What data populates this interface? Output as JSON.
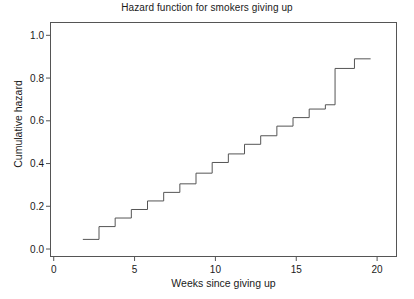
{
  "chart_data": {
    "type": "line",
    "subtype": "step",
    "title": "Hazard function for smokers giving up",
    "xlabel": "Weeks since giving up",
    "ylabel": "Cumulative hazard",
    "xlim": [
      -0.2,
      21.2
    ],
    "ylim": [
      -0.035,
      1.06
    ],
    "xticks": [
      0,
      5,
      10,
      15,
      20
    ],
    "xticklabels": [
      "0",
      "5",
      "10",
      "15",
      "20"
    ],
    "yticks": [
      0.0,
      0.2,
      0.4,
      0.6,
      0.8,
      1.0
    ],
    "yticklabels": [
      "0.0",
      "0.2",
      "0.4",
      "0.6",
      "0.8",
      "1.0"
    ],
    "grid": false,
    "legend": false,
    "frame": true,
    "line_color": "#555555",
    "line_width": 1.0,
    "series": [
      {
        "name": "Cumulative hazard",
        "x": [
          1.8,
          2.8,
          2.8,
          3.8,
          3.8,
          4.8,
          4.8,
          5.8,
          5.8,
          6.8,
          6.8,
          7.8,
          7.8,
          8.8,
          8.8,
          9.8,
          9.8,
          10.8,
          10.8,
          11.8,
          11.8,
          12.8,
          12.8,
          13.8,
          13.8,
          14.8,
          14.8,
          15.8,
          15.8,
          16.8,
          16.8,
          17.4,
          17.4,
          18.6,
          18.6,
          19.6
        ],
        "y": [
          0.045,
          0.045,
          0.105,
          0.105,
          0.145,
          0.145,
          0.185,
          0.185,
          0.225,
          0.225,
          0.265,
          0.265,
          0.305,
          0.305,
          0.355,
          0.355,
          0.405,
          0.405,
          0.445,
          0.445,
          0.49,
          0.49,
          0.53,
          0.53,
          0.575,
          0.575,
          0.615,
          0.615,
          0.655,
          0.655,
          0.675,
          0.675,
          0.845,
          0.845,
          0.89,
          0.89
        ]
      }
    ]
  }
}
